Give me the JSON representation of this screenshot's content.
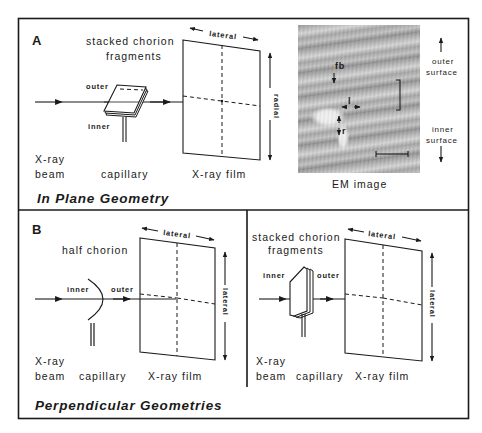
{
  "panel_a": {
    "letter": "A",
    "title": "In Plane Geometry",
    "labels": {
      "sample": [
        "stacked chorion",
        "fragments"
      ],
      "outer": "outer",
      "inner": "inner",
      "beam": [
        "X-ray",
        "beam"
      ],
      "capillary": "capillary",
      "film": "X-ray film",
      "film_top_axis": "lateral",
      "film_side_axis": "radial"
    },
    "em_image": {
      "caption": "EM image",
      "annotations": {
        "fb": "fb",
        "l": "l",
        "r": "r"
      },
      "outer_surface": [
        "outer",
        "surface"
      ],
      "inner_surface": [
        "inner",
        "surface"
      ]
    }
  },
  "panel_b": {
    "letter": "B",
    "title": "Perpendicular Geometries",
    "left": {
      "sample": "half chorion",
      "inner": "inner",
      "outer": "outer",
      "beam": [
        "X-ray",
        "beam"
      ],
      "capillary": "capillary",
      "film": "X-ray film",
      "film_top_axis": "lateral",
      "film_side_axis": "lateral"
    },
    "right": {
      "sample": [
        "stacked chorion",
        "fragments"
      ],
      "inner": "inner",
      "outer": "outer",
      "beam": [
        "X-ray",
        "beam"
      ],
      "capillary": "capillary",
      "film": "X-ray film",
      "film_top_axis": "lateral",
      "film_side_axis": "lateral"
    }
  },
  "colors": {
    "ink": "#1a1a1a",
    "background": "#ffffff"
  }
}
